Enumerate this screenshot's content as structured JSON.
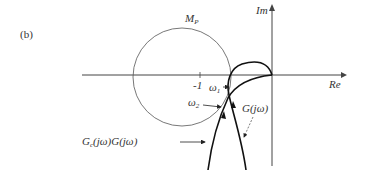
{
  "figure": {
    "panel_label": "(b)",
    "axes": {
      "imag_label": "Im",
      "real_label": "Re"
    },
    "circle_label_main": "M",
    "circle_label_sub": "P",
    "point_label": "-1",
    "omega1_main": "ω",
    "omega1_sub": "1",
    "omega2_main": "ω",
    "omega2_sub": "2",
    "curve_g_label": "G(jω)",
    "curve_gcg_label_a": "G",
    "curve_gcg_label_sub": "c",
    "curve_gcg_label_b": "(jω)G(jω)"
  }
}
